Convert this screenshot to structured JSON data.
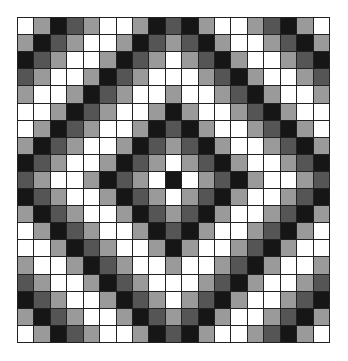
{
  "diagram": {
    "type": "grid-pattern",
    "rows": 19,
    "cols": 19,
    "center": [
      9,
      9
    ],
    "rule": "shade = sequence[|row-9| + |col-9|]",
    "palette": {
      "W": "#ffffff",
      "L": "#9a9a9a",
      "D": "#555555",
      "B": "#161616"
    },
    "sequence_by_distance": [
      "B",
      "W",
      "L",
      "D",
      "B",
      "L",
      "W",
      "W",
      "L",
      "D",
      "B",
      "L",
      "W",
      "W",
      "L",
      "D",
      "B",
      "L",
      "W"
    ],
    "grid": [
      [
        "W",
        "L",
        "B",
        "D",
        "L",
        "W",
        "W",
        "L",
        "B",
        "D",
        "B",
        "L",
        "W",
        "W",
        "L",
        "D",
        "B",
        "L",
        "W"
      ],
      [
        "L",
        "B",
        "D",
        "L",
        "W",
        "W",
        "L",
        "B",
        "D",
        "L",
        "D",
        "B",
        "L",
        "W",
        "W",
        "L",
        "D",
        "B",
        "L"
      ],
      [
        "B",
        "D",
        "L",
        "W",
        "W",
        "L",
        "B",
        "D",
        "L",
        "W",
        "L",
        "D",
        "B",
        "L",
        "W",
        "W",
        "L",
        "D",
        "B"
      ],
      [
        "D",
        "L",
        "W",
        "W",
        "L",
        "B",
        "D",
        "L",
        "W",
        "W",
        "W",
        "L",
        "D",
        "B",
        "L",
        "W",
        "W",
        "L",
        "D"
      ],
      [
        "L",
        "W",
        "W",
        "L",
        "B",
        "D",
        "L",
        "W",
        "W",
        "L",
        "W",
        "W",
        "L",
        "D",
        "B",
        "L",
        "W",
        "W",
        "L"
      ],
      [
        "W",
        "W",
        "L",
        "B",
        "D",
        "L",
        "W",
        "W",
        "L",
        "B",
        "L",
        "W",
        "W",
        "L",
        "D",
        "B",
        "L",
        "W",
        "W"
      ],
      [
        "W",
        "L",
        "B",
        "D",
        "L",
        "W",
        "W",
        "L",
        "B",
        "D",
        "B",
        "L",
        "W",
        "W",
        "L",
        "D",
        "B",
        "L",
        "W"
      ],
      [
        "L",
        "B",
        "D",
        "L",
        "W",
        "W",
        "L",
        "B",
        "D",
        "L",
        "D",
        "B",
        "L",
        "W",
        "W",
        "L",
        "D",
        "B",
        "L"
      ],
      [
        "B",
        "D",
        "L",
        "W",
        "W",
        "L",
        "B",
        "D",
        "L",
        "W",
        "L",
        "D",
        "B",
        "L",
        "W",
        "W",
        "L",
        "D",
        "B"
      ],
      [
        "D",
        "L",
        "W",
        "W",
        "L",
        "B",
        "D",
        "L",
        "W",
        "B",
        "W",
        "L",
        "D",
        "B",
        "L",
        "W",
        "W",
        "L",
        "D"
      ],
      [
        "B",
        "D",
        "L",
        "W",
        "W",
        "L",
        "B",
        "D",
        "L",
        "W",
        "L",
        "D",
        "B",
        "L",
        "W",
        "W",
        "L",
        "D",
        "B"
      ],
      [
        "L",
        "B",
        "D",
        "L",
        "W",
        "W",
        "L",
        "B",
        "D",
        "L",
        "D",
        "B",
        "L",
        "W",
        "W",
        "L",
        "D",
        "B",
        "L"
      ],
      [
        "W",
        "L",
        "B",
        "D",
        "L",
        "W",
        "W",
        "L",
        "B",
        "D",
        "B",
        "L",
        "W",
        "W",
        "L",
        "D",
        "B",
        "L",
        "W"
      ],
      [
        "W",
        "W",
        "L",
        "B",
        "D",
        "L",
        "W",
        "W",
        "L",
        "B",
        "L",
        "W",
        "W",
        "L",
        "D",
        "B",
        "L",
        "W",
        "W"
      ],
      [
        "L",
        "W",
        "W",
        "L",
        "B",
        "D",
        "L",
        "W",
        "W",
        "L",
        "W",
        "W",
        "L",
        "D",
        "B",
        "L",
        "W",
        "W",
        "L"
      ],
      [
        "D",
        "L",
        "W",
        "W",
        "L",
        "B",
        "D",
        "L",
        "W",
        "W",
        "W",
        "L",
        "D",
        "B",
        "L",
        "W",
        "W",
        "L",
        "D"
      ],
      [
        "B",
        "D",
        "L",
        "W",
        "W",
        "L",
        "B",
        "D",
        "L",
        "W",
        "L",
        "D",
        "B",
        "L",
        "W",
        "W",
        "L",
        "D",
        "B"
      ],
      [
        "L",
        "B",
        "D",
        "L",
        "W",
        "W",
        "L",
        "B",
        "D",
        "L",
        "D",
        "B",
        "L",
        "W",
        "W",
        "L",
        "D",
        "B",
        "L"
      ],
      [
        "W",
        "L",
        "B",
        "D",
        "L",
        "W",
        "W",
        "L",
        "B",
        "D",
        "B",
        "L",
        "W",
        "W",
        "L",
        "D",
        "B",
        "L",
        "W"
      ]
    ]
  }
}
